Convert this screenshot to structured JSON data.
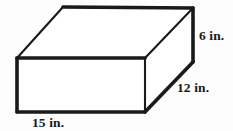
{
  "figure": {
    "type": "rectangular-prism",
    "shape_name": "rectangular prism",
    "background_color": "#fdfdfd",
    "line_color": "#1a1a1a",
    "face_fill_color": "#ffffff",
    "labels": {
      "height": "6 in.",
      "depth": "12 in.",
      "width": "15 in."
    },
    "dimensions": {
      "height_value": 6,
      "depth_value": 12,
      "width_value": 15,
      "unit": "in."
    },
    "geometry": {
      "front_face": "17,58 145,58 145,112 17,112",
      "top_face": "17,58 63,7 193,8 145,58",
      "right_face": "145,58 193,8 193,62 145,112",
      "edge_front_top": "17,58 145,58",
      "edge_front_right": "145,58 145,112",
      "edge_front_bottom": "17,112 145,112",
      "edge_front_left": "17,58 17,112",
      "edge_top_back_left": "17,58 63,7",
      "edge_top_back": "63,7 193,8",
      "edge_top_right": "145,58 193,8",
      "edge_right_vertical": "193,8 193,62",
      "edge_right_bottom": "193,62 145,112"
    }
  }
}
